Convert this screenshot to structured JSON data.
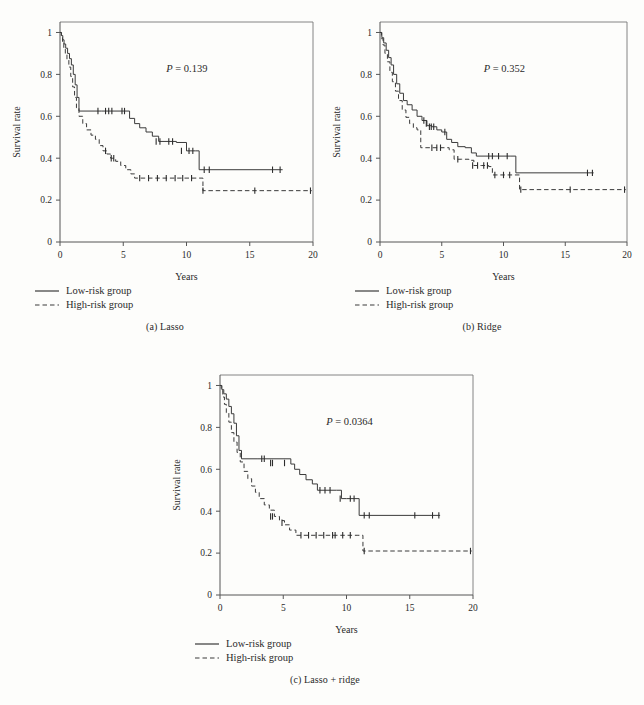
{
  "figure": {
    "background": "#fdfdfb",
    "line_color": "#3a3a3a",
    "axis_color": "#555555"
  },
  "legend": {
    "low_risk_label": "Low-risk group",
    "high_risk_label": "High-risk group",
    "low_risk_style": "solid",
    "high_risk_style": "dashed"
  },
  "axes": {
    "xlabel": "Years",
    "ylabel": "Survival rate",
    "xticks": [
      "0",
      "5",
      "10",
      "15",
      "20"
    ],
    "xtick_values": [
      0,
      5,
      10,
      15,
      20
    ],
    "yticks": [
      "0",
      "0.2",
      "0.4",
      "0.6",
      "0.8",
      "1"
    ],
    "ytick_values": [
      0,
      0.2,
      0.4,
      0.6,
      0.8,
      1.0
    ],
    "xlim": [
      0,
      20
    ],
    "ylim": [
      0,
      1.05
    ],
    "grid": false
  },
  "chart_data": [
    {
      "id": "a",
      "type": "line",
      "title": "",
      "caption": "(a) Lasso",
      "caption_index": "(a)",
      "caption_text": "Lasso",
      "annotation_p_symbol": "P",
      "annotation_p_eq": " = ",
      "annotation_p_value": "0.139",
      "xlabel": "Years",
      "ylabel": "Survival rate",
      "xlim": [
        0,
        20
      ],
      "ylim": [
        0,
        1.05
      ],
      "series": [
        {
          "name": "Low-risk group",
          "style": "solid",
          "x": [
            0,
            0.12,
            0.22,
            0.32,
            0.45,
            0.6,
            0.75,
            0.9,
            1.05,
            1.2,
            1.35,
            1.5,
            3.3,
            5.5,
            5.9,
            6.3,
            6.8,
            7.3,
            7.8,
            8.3,
            9.2,
            10.0,
            10.7,
            11.0,
            17.6
          ],
          "y": [
            1.0,
            0.985,
            0.965,
            0.945,
            0.925,
            0.9,
            0.875,
            0.845,
            0.8,
            0.75,
            0.69,
            0.625,
            0.625,
            0.59,
            0.565,
            0.545,
            0.525,
            0.505,
            0.48,
            0.48,
            0.475,
            0.435,
            0.435,
            0.345,
            0.345
          ],
          "censor_x": [
            3.0,
            3.6,
            3.85,
            4.1,
            4.9,
            5.1,
            7.6,
            7.9,
            8.6,
            8.9,
            9.6,
            10.2,
            10.5,
            11.4,
            11.8,
            16.8,
            17.4
          ],
          "censor_y": [
            0.625,
            0.625,
            0.625,
            0.625,
            0.625,
            0.625,
            0.48,
            0.48,
            0.48,
            0.48,
            0.435,
            0.435,
            0.435,
            0.345,
            0.345,
            0.345,
            0.345
          ]
        },
        {
          "name": "High-risk group",
          "style": "dashed",
          "x": [
            0,
            0.1,
            0.2,
            0.3,
            0.42,
            0.55,
            0.7,
            0.85,
            1.0,
            1.15,
            1.3,
            1.5,
            1.8,
            2.1,
            2.45,
            2.8,
            3.1,
            3.4,
            3.7,
            4.0,
            4.4,
            4.8,
            5.2,
            5.6,
            5.9,
            11.0,
            11.3,
            19.9
          ],
          "y": [
            1.0,
            0.975,
            0.95,
            0.925,
            0.9,
            0.87,
            0.835,
            0.79,
            0.74,
            0.69,
            0.64,
            0.6,
            0.565,
            0.535,
            0.51,
            0.49,
            0.46,
            0.435,
            0.42,
            0.4,
            0.385,
            0.365,
            0.345,
            0.325,
            0.305,
            0.305,
            0.245,
            0.245
          ],
          "censor_x": [
            3.6,
            4.05,
            4.25,
            6.3,
            7.0,
            7.7,
            8.4,
            9.1,
            9.7,
            10.4,
            11.3,
            15.4,
            19.8
          ],
          "censor_y": [
            0.435,
            0.4,
            0.4,
            0.305,
            0.305,
            0.305,
            0.305,
            0.305,
            0.305,
            0.305,
            0.245,
            0.245,
            0.245
          ]
        }
      ]
    },
    {
      "id": "b",
      "type": "line",
      "title": "",
      "caption": "(b) Ridge",
      "caption_index": "(b)",
      "caption_text": "Ridge",
      "annotation_p_symbol": "P",
      "annotation_p_eq": " = ",
      "annotation_p_value": "0.352",
      "xlabel": "Years",
      "ylabel": "Survival rate",
      "xlim": [
        0,
        20
      ],
      "ylim": [
        0,
        1.05
      ],
      "series": [
        {
          "name": "Low-risk group",
          "style": "solid",
          "x": [
            0,
            0.15,
            0.3,
            0.5,
            0.7,
            0.9,
            1.1,
            1.35,
            1.6,
            1.9,
            2.2,
            2.6,
            3.0,
            3.4,
            3.8,
            4.2,
            4.6,
            5.0,
            5.4,
            5.8,
            6.3,
            6.9,
            7.4,
            7.8,
            10.6,
            11.0,
            17.3
          ],
          "y": [
            1.0,
            0.975,
            0.95,
            0.915,
            0.88,
            0.845,
            0.8,
            0.755,
            0.71,
            0.675,
            0.655,
            0.63,
            0.6,
            0.58,
            0.555,
            0.55,
            0.535,
            0.525,
            0.49,
            0.475,
            0.455,
            0.45,
            0.425,
            0.41,
            0.41,
            0.33,
            0.33
          ],
          "censor_x": [
            3.55,
            3.75,
            4.0,
            4.15,
            4.35,
            5.25,
            8.8,
            9.1,
            9.6,
            10.3,
            16.8,
            17.2
          ],
          "censor_y": [
            0.58,
            0.565,
            0.55,
            0.55,
            0.55,
            0.525,
            0.41,
            0.41,
            0.41,
            0.41,
            0.33,
            0.33
          ]
        },
        {
          "name": "High-risk group",
          "style": "dashed",
          "x": [
            0,
            0.12,
            0.25,
            0.4,
            0.6,
            0.8,
            1.0,
            1.25,
            1.5,
            1.8,
            2.1,
            2.4,
            2.7,
            3.0,
            3.3,
            4.1,
            5.6,
            6.0,
            6.6,
            7.2,
            7.6,
            8.2,
            8.8,
            9.1,
            9.5,
            10.9,
            11.3,
            19.9
          ],
          "y": [
            1.0,
            0.97,
            0.94,
            0.9,
            0.86,
            0.81,
            0.765,
            0.72,
            0.675,
            0.63,
            0.595,
            0.565,
            0.545,
            0.535,
            0.45,
            0.45,
            0.44,
            0.395,
            0.395,
            0.39,
            0.365,
            0.365,
            0.36,
            0.32,
            0.32,
            0.32,
            0.25,
            0.25
          ],
          "censor_x": [
            4.2,
            4.6,
            4.9,
            6.3,
            7.5,
            7.9,
            8.4,
            8.7,
            9.3,
            10.0,
            10.5,
            11.4,
            15.4,
            19.8
          ],
          "censor_y": [
            0.45,
            0.45,
            0.45,
            0.395,
            0.365,
            0.365,
            0.365,
            0.365,
            0.32,
            0.32,
            0.32,
            0.25,
            0.25,
            0.25
          ]
        }
      ]
    },
    {
      "id": "c",
      "type": "line",
      "title": "",
      "caption": "(c) Lasso + ridge",
      "caption_index": "(c)",
      "caption_text": "Lasso + ridge",
      "annotation_p_symbol": "P",
      "annotation_p_eq": " = ",
      "annotation_p_value": "0.0364",
      "xlabel": "Years",
      "ylabel": "Survival rate",
      "xlim": [
        0,
        20
      ],
      "ylim": [
        0,
        1.05
      ],
      "series": [
        {
          "name": "Low-risk group",
          "style": "solid",
          "x": [
            0,
            0.15,
            0.3,
            0.5,
            0.7,
            0.9,
            1.1,
            1.3,
            1.5,
            1.7,
            3.0,
            5.6,
            5.9,
            6.3,
            6.8,
            7.3,
            7.7,
            9.2,
            9.6,
            10.0,
            10.6,
            11.0,
            17.4
          ],
          "y": [
            1.0,
            0.98,
            0.96,
            0.935,
            0.9,
            0.865,
            0.82,
            0.76,
            0.69,
            0.65,
            0.65,
            0.625,
            0.6,
            0.575,
            0.55,
            0.53,
            0.5,
            0.5,
            0.46,
            0.46,
            0.46,
            0.38,
            0.38
          ],
          "censor_x": [
            3.3,
            3.5,
            4.0,
            4.15,
            5.1,
            7.9,
            8.3,
            8.7,
            9.5,
            10.3,
            10.6,
            11.4,
            11.8,
            15.4,
            16.8,
            17.3
          ],
          "censor_y": [
            0.65,
            0.65,
            0.63,
            0.63,
            0.63,
            0.5,
            0.5,
            0.5,
            0.46,
            0.46,
            0.46,
            0.38,
            0.38,
            0.38,
            0.38,
            0.38
          ]
        },
        {
          "name": "High-risk group",
          "style": "dashed",
          "x": [
            0,
            0.1,
            0.22,
            0.35,
            0.5,
            0.7,
            0.9,
            1.1,
            1.35,
            1.6,
            1.9,
            2.2,
            2.5,
            2.8,
            3.1,
            3.5,
            3.9,
            4.3,
            4.7,
            5.1,
            5.5,
            6.0,
            10.9,
            11.3,
            19.9
          ],
          "y": [
            1.0,
            0.975,
            0.945,
            0.91,
            0.87,
            0.825,
            0.775,
            0.73,
            0.68,
            0.635,
            0.59,
            0.555,
            0.52,
            0.49,
            0.46,
            0.43,
            0.405,
            0.375,
            0.355,
            0.335,
            0.31,
            0.285,
            0.285,
            0.21,
            0.21
          ],
          "censor_x": [
            4.0,
            4.15,
            4.9,
            6.4,
            7.0,
            7.6,
            8.2,
            8.9,
            9.1,
            9.7,
            10.3,
            11.4,
            19.8
          ],
          "censor_y": [
            0.375,
            0.375,
            0.345,
            0.285,
            0.285,
            0.285,
            0.285,
            0.285,
            0.285,
            0.285,
            0.285,
            0.21,
            0.21
          ]
        }
      ]
    }
  ]
}
